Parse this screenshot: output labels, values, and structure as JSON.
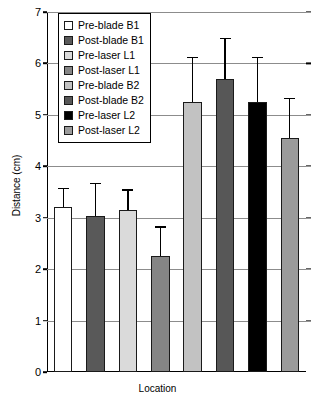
{
  "chart_data": {
    "type": "bar",
    "title": "",
    "xlabel": "Location",
    "ylabel": "Distance (cm)",
    "ylim": [
      0,
      7
    ],
    "yticks": [
      0,
      1,
      2,
      3,
      4,
      5,
      6,
      7
    ],
    "ytick_labels": [
      "0",
      "1",
      "2",
      "3",
      "4",
      "5",
      "6",
      "7"
    ],
    "grid": true,
    "legend_position": "upper-left-inside",
    "xtick_labels": [],
    "categories": [
      "Pre-blade B1",
      "Post-blade B1",
      "Pre-laser L1",
      "Post-laser L1",
      "Pre-blade B2",
      "Post-blade B2",
      "Pre-laser L2",
      "Post-laser L2"
    ],
    "values": [
      3.2,
      3.03,
      3.15,
      2.26,
      5.25,
      5.7,
      5.25,
      4.55
    ],
    "errors": [
      0.38,
      0.65,
      0.4,
      0.57,
      0.88,
      0.8,
      0.88,
      0.78
    ],
    "colors": [
      "#ffffff",
      "#595959",
      "#dadada",
      "#858585",
      "#c2c2c2",
      "#575757",
      "#000000",
      "#9b9b9b"
    ]
  },
  "legend": {
    "items": [
      {
        "label": "Pre-blade B1",
        "color": "#ffffff"
      },
      {
        "label": "Post-blade B1",
        "color": "#595959"
      },
      {
        "label": "Pre-laser L1",
        "color": "#dadada"
      },
      {
        "label": "Post-laser L1",
        "color": "#858585"
      },
      {
        "label": "Pre-blade B2",
        "color": "#c2c2c2"
      },
      {
        "label": "Post-blade B2",
        "color": "#575757"
      },
      {
        "label": "Pre-laser L2",
        "color": "#000000"
      },
      {
        "label": "Post-laser L2",
        "color": "#9b9b9b"
      }
    ]
  }
}
